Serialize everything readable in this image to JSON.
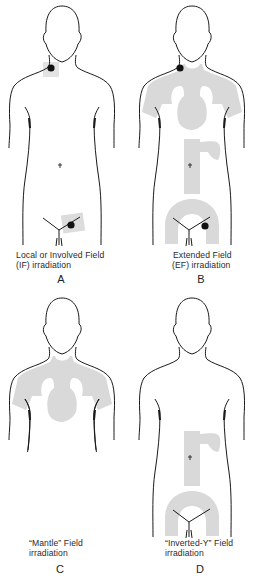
{
  "figures": [
    {
      "id": "A",
      "letter": "A",
      "caption_line1": "Local or Involved Field",
      "caption_line2": "(IF) irradiation",
      "fields": [
        "left-neck-node",
        "right-inguinal-node"
      ]
    },
    {
      "id": "B",
      "letter": "B",
      "caption_line1": "Extended Field",
      "caption_line2": "(EF) irradiation",
      "fields": [
        "mantle",
        "para-aortic-spleen",
        "pelvic-inverted-y"
      ]
    },
    {
      "id": "C",
      "letter": "C",
      "caption_line1": "“Mantle” Field",
      "caption_line2": "irradiation",
      "fields": [
        "mantle"
      ]
    },
    {
      "id": "D",
      "letter": "D",
      "caption_line1": "“Inverted-Y” Field",
      "caption_line2": "irradiation",
      "fields": [
        "para-aortic-spleen",
        "pelvic-inverted-y"
      ]
    }
  ],
  "colors": {
    "outline": "#1a1a1a",
    "field_shade": "#d9d9d9",
    "node": "#111111",
    "background": "#ffffff"
  }
}
